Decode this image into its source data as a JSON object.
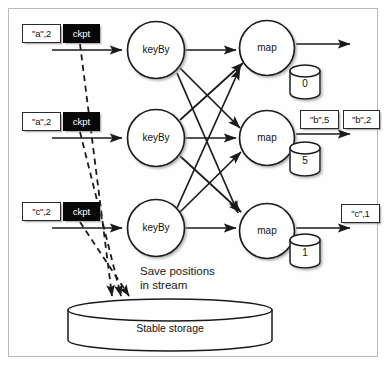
{
  "figure": {
    "background": "#ffffff",
    "frame_color": "#b9b9b9",
    "line_color": "#1a1a1a",
    "ckpt_fill": "#080808",
    "ckpt_text_color": "#ffffff"
  },
  "inputs": [
    {
      "token": "\"a\",2",
      "barrier": "ckpt"
    },
    {
      "token": "\"a\",2",
      "barrier": "ckpt"
    },
    {
      "token": "\"c\",2",
      "barrier": "ckpt"
    }
  ],
  "key_by_nodes": [
    {
      "label": "keyBy"
    },
    {
      "label": "keyBy"
    },
    {
      "label": "keyBy"
    }
  ],
  "map_nodes": [
    {
      "label": "map",
      "state": "0"
    },
    {
      "label": "map",
      "state": "5"
    },
    {
      "label": "map",
      "state": "1"
    }
  ],
  "outputs": [
    {
      "tokens": []
    },
    {
      "tokens": [
        "\"b\",5",
        "\"b\",2"
      ]
    },
    {
      "tokens": [
        "\"c\",1"
      ]
    }
  ],
  "caption": {
    "line1": "Save positions",
    "line2": "in stream",
    "full": "Save positions\nin stream"
  },
  "storage": {
    "label": "Stable storage"
  }
}
